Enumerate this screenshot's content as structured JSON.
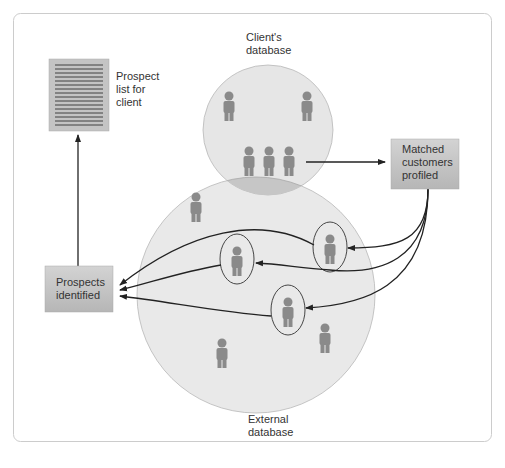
{
  "diagram": {
    "labels": {
      "client_database": [
        "Client's",
        "database"
      ],
      "external_database": [
        "External",
        "database"
      ],
      "prospect_list": [
        "Prospect",
        "list for",
        "client"
      ],
      "matched_customers": [
        "Matched",
        "customers",
        "profiled"
      ],
      "prospects_identified": [
        "Prospects",
        "identified"
      ]
    },
    "colors": {
      "frame_border": "#cccccc",
      "client_circle_fill": "#e6e6e6",
      "external_circle_fill": "#e9e9e9",
      "overlap_fill": "#c4c4c4",
      "person_fill": "#8a8a8a",
      "box_fill_top": "#d0d0d0",
      "box_fill_bottom": "#b8b8b8",
      "arrow": "#222222"
    }
  }
}
